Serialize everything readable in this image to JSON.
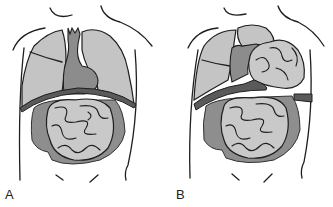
{
  "figure": {
    "panels": [
      {
        "id": "A",
        "label": "A",
        "description": "Normal anatomy: lungs and heart above an intact diaphragm; small bowel and colon below"
      },
      {
        "id": "B",
        "label": "B",
        "description": "Diaphragmatic defect: bowel loops herniated into the left chest, displacing heart and compressing lung"
      }
    ],
    "colors": {
      "outline": "#1e1e1e",
      "lung": "#c4c4c4",
      "heart": "#8c8c8c",
      "diaphragm": "#5a5a5a",
      "colon": "#8e8e8e",
      "small_bowel": "#c9c9c9",
      "background": "#ffffff"
    }
  }
}
